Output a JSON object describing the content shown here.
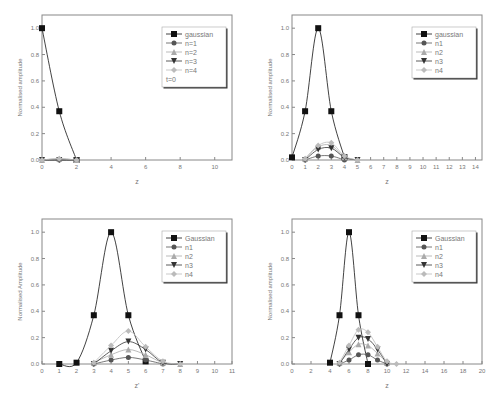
{
  "chart_data": [
    {
      "type": "line",
      "title": "",
      "xlabel": "z",
      "ylabel": "Normalised amplitude",
      "xlim": [
        0,
        11
      ],
      "ylim": [
        0,
        1.1
      ],
      "xticks": [
        0,
        2,
        4,
        6,
        8,
        10
      ],
      "yticks": [
        0.0,
        0.2,
        0.4,
        0.6,
        0.8,
        1.0
      ],
      "legend_position": "upper right",
      "annotation": "t=0",
      "series": [
        {
          "name": "gaussian",
          "x": [
            0,
            1,
            2
          ],
          "values": [
            1.0,
            0.37,
            0.0
          ],
          "marker": "square",
          "color": "#111111"
        },
        {
          "name": "n=1",
          "x": [
            0,
            1,
            2
          ],
          "values": [
            0.0,
            0.0,
            0.0
          ],
          "marker": "circle",
          "color": "#555555"
        },
        {
          "name": "n=2",
          "x": [
            0,
            1,
            2
          ],
          "values": [
            0.0,
            0.01,
            0.0
          ],
          "marker": "triangle-up",
          "color": "#aaaaaa"
        },
        {
          "name": "n=3",
          "x": [
            0,
            1,
            2
          ],
          "values": [
            0.0,
            0.0,
            0.0
          ],
          "marker": "triangle-down",
          "color": "#333333"
        },
        {
          "name": "n=4",
          "x": [
            0,
            1,
            2
          ],
          "values": [
            0.0,
            0.01,
            0.0
          ],
          "marker": "diamond",
          "color": "#bbbbbb"
        }
      ]
    },
    {
      "type": "line",
      "title": "",
      "xlabel": "z",
      "ylabel": "Normalised amplitude",
      "xlim": [
        0,
        14.5
      ],
      "ylim": [
        0,
        1.1
      ],
      "xticks": [
        0,
        1,
        2,
        3,
        4,
        5,
        6,
        7,
        8,
        9,
        10,
        11,
        12,
        13,
        14
      ],
      "yticks": [
        0.0,
        0.2,
        0.4,
        0.6,
        0.8,
        1.0
      ],
      "legend_position": "upper right",
      "series": [
        {
          "name": "gaussian",
          "x": [
            0,
            1,
            2,
            3,
            4
          ],
          "values": [
            0.02,
            0.37,
            1.0,
            0.37,
            0.02
          ],
          "marker": "square",
          "color": "#111111"
        },
        {
          "name": "n1",
          "x": [
            1,
            2,
            3,
            4
          ],
          "values": [
            0.0,
            0.03,
            0.03,
            0.0
          ],
          "marker": "circle",
          "color": "#555555"
        },
        {
          "name": "n2",
          "x": [
            1,
            2,
            3,
            4,
            5
          ],
          "values": [
            0.01,
            0.1,
            0.11,
            0.02,
            0.0
          ],
          "marker": "triangle-up",
          "color": "#aaaaaa"
        },
        {
          "name": "n3",
          "x": [
            1,
            2,
            3,
            4,
            5
          ],
          "values": [
            0.0,
            0.08,
            0.09,
            0.02,
            0.0
          ],
          "marker": "triangle-down",
          "color": "#333333"
        },
        {
          "name": "n4",
          "x": [
            1,
            2,
            3,
            4,
            5
          ],
          "values": [
            0.01,
            0.11,
            0.13,
            0.03,
            0.0
          ],
          "marker": "diamond",
          "color": "#bbbbbb"
        }
      ]
    },
    {
      "type": "line",
      "title": "",
      "xlabel": "z'",
      "ylabel": "Normalised Amplitude",
      "xlim": [
        0,
        11
      ],
      "ylim": [
        0,
        1.1
      ],
      "xticks": [
        0,
        1,
        2,
        3,
        4,
        5,
        6,
        7,
        8,
        9,
        10,
        11
      ],
      "yticks": [
        0.0,
        0.2,
        0.4,
        0.6,
        0.8,
        1.0
      ],
      "legend_position": "upper right",
      "series": [
        {
          "name": "Gaussian",
          "x": [
            1,
            2,
            3,
            4,
            5,
            6
          ],
          "values": [
            0.0,
            0.01,
            0.37,
            1.0,
            0.37,
            0.02
          ],
          "marker": "square",
          "color": "#111111"
        },
        {
          "name": "n1",
          "x": [
            3,
            4,
            5,
            6,
            7
          ],
          "values": [
            0.0,
            0.03,
            0.05,
            0.03,
            0.0
          ],
          "marker": "circle",
          "color": "#555555"
        },
        {
          "name": "n2",
          "x": [
            3,
            4,
            5,
            6,
            7,
            8
          ],
          "values": [
            0.01,
            0.07,
            0.11,
            0.07,
            0.01,
            0.0
          ],
          "marker": "triangle-up",
          "color": "#aaaaaa"
        },
        {
          "name": "n3",
          "x": [
            3,
            4,
            5,
            6,
            7,
            8
          ],
          "values": [
            0.0,
            0.1,
            0.17,
            0.11,
            0.01,
            0.0
          ],
          "marker": "triangle-down",
          "color": "#333333"
        },
        {
          "name": "n4",
          "x": [
            3,
            4,
            5,
            6,
            7,
            8
          ],
          "values": [
            0.01,
            0.14,
            0.25,
            0.13,
            0.02,
            0.0
          ],
          "marker": "diamond",
          "color": "#bbbbbb"
        }
      ]
    },
    {
      "type": "line",
      "title": "",
      "xlabel": "z",
      "ylabel": "Normalised amplitude",
      "xlim": [
        0,
        20
      ],
      "ylim": [
        0,
        1.1
      ],
      "xticks": [
        0,
        2,
        4,
        6,
        8,
        10,
        12,
        14,
        16,
        18,
        20
      ],
      "yticks": [
        0.0,
        0.2,
        0.4,
        0.6,
        0.8,
        1.0
      ],
      "legend_position": "upper right",
      "series": [
        {
          "name": "Gaussian",
          "x": [
            4,
            5,
            6,
            7,
            8
          ],
          "values": [
            0.01,
            0.37,
            1.0,
            0.37,
            0.0
          ],
          "marker": "square",
          "color": "#111111"
        },
        {
          "name": "n1",
          "x": [
            5,
            6,
            7,
            8,
            9,
            10
          ],
          "values": [
            0.0,
            0.03,
            0.07,
            0.07,
            0.03,
            0.0
          ],
          "marker": "circle",
          "color": "#555555"
        },
        {
          "name": "n2",
          "x": [
            5,
            6,
            7,
            8,
            9,
            10
          ],
          "values": [
            0.01,
            0.09,
            0.15,
            0.14,
            0.08,
            0.01
          ],
          "marker": "triangle-up",
          "color": "#aaaaaa"
        },
        {
          "name": "n3",
          "x": [
            5,
            6,
            7,
            8,
            9,
            10
          ],
          "values": [
            0.0,
            0.11,
            0.2,
            0.19,
            0.11,
            0.0
          ],
          "marker": "triangle-down",
          "color": "#333333"
        },
        {
          "name": "n4",
          "x": [
            5,
            6,
            7,
            8,
            9,
            10,
            11
          ],
          "values": [
            0.01,
            0.14,
            0.26,
            0.24,
            0.13,
            0.02,
            0.0
          ],
          "marker": "diamond",
          "color": "#bbbbbb"
        }
      ]
    }
  ]
}
